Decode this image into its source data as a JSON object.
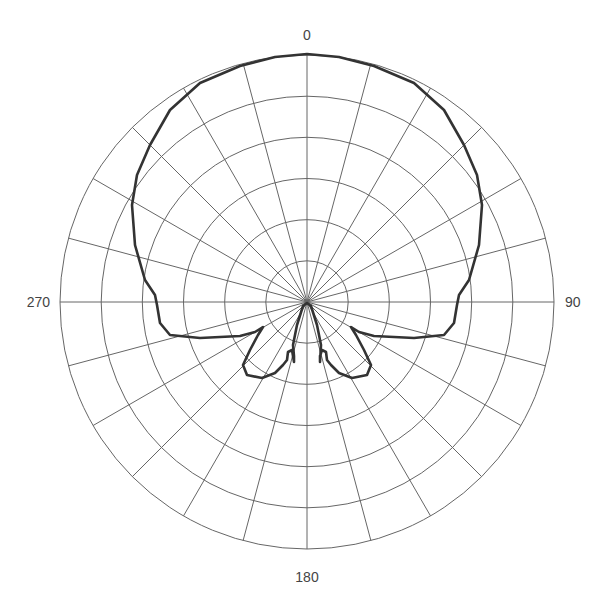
{
  "chart_data": {
    "type": "polar-line",
    "title": "",
    "angle_tick_labels": [
      {
        "angle": 0,
        "label": "0"
      },
      {
        "angle": 90,
        "label": "90"
      },
      {
        "angle": 180,
        "label": "180"
      },
      {
        "angle": 270,
        "label": "270"
      }
    ],
    "angular_gridlines_deg": [
      0,
      15,
      30,
      45,
      60,
      75,
      90,
      105,
      120,
      135,
      150,
      165,
      180,
      195,
      210,
      225,
      240,
      255,
      270,
      285,
      300,
      315,
      330,
      345
    ],
    "radial_rings": 6,
    "radial_range": [
      0,
      1
    ],
    "grid": true,
    "legend": null,
    "series": [
      {
        "name": "radiation-pattern",
        "color": "#333333",
        "note": "Normalized radius (0-1) vs angle in degrees, clockwise from top (0). Cardioid-like main lobe with two small back lobes.",
        "points": [
          {
            "angle": 0,
            "r": 1.0
          },
          {
            "angle": 15,
            "r": 0.99
          },
          {
            "angle": 30,
            "r": 0.97
          },
          {
            "angle": 45,
            "r": 0.94
          },
          {
            "angle": 60,
            "r": 0.88
          },
          {
            "angle": 75,
            "r": 0.72
          },
          {
            "angle": 90,
            "r": 0.62
          },
          {
            "angle": 100,
            "r": 0.64
          },
          {
            "angle": 105,
            "r": 0.55
          },
          {
            "angle": 110,
            "r": 0.28
          },
          {
            "angle": 115,
            "r": 0.23
          },
          {
            "angle": 120,
            "r": 0.16
          },
          {
            "angle": 130,
            "r": 0.36
          },
          {
            "angle": 140,
            "r": 0.36
          },
          {
            "angle": 150,
            "r": 0.33
          },
          {
            "angle": 160,
            "r": 0.22
          },
          {
            "angle": 163,
            "r": 0.26
          },
          {
            "angle": 170,
            "r": 0.1
          },
          {
            "angle": 180,
            "r": 0.0
          },
          {
            "angle": 190,
            "r": 0.1
          },
          {
            "angle": 197,
            "r": 0.26
          },
          {
            "angle": 200,
            "r": 0.22
          },
          {
            "angle": 210,
            "r": 0.33
          },
          {
            "angle": 220,
            "r": 0.36
          },
          {
            "angle": 230,
            "r": 0.36
          },
          {
            "angle": 240,
            "r": 0.16
          },
          {
            "angle": 245,
            "r": 0.23
          },
          {
            "angle": 250,
            "r": 0.28
          },
          {
            "angle": 255,
            "r": 0.55
          },
          {
            "angle": 260,
            "r": 0.64
          },
          {
            "angle": 270,
            "r": 0.62
          },
          {
            "angle": 285,
            "r": 0.72
          },
          {
            "angle": 300,
            "r": 0.88
          },
          {
            "angle": 315,
            "r": 0.94
          },
          {
            "angle": 330,
            "r": 0.97
          },
          {
            "angle": 345,
            "r": 0.99
          },
          {
            "angle": 360,
            "r": 1.0
          }
        ]
      }
    ]
  },
  "labels": {
    "top": "0",
    "right": "90",
    "bottom": "180",
    "left": "270"
  },
  "colors": {
    "grid": "#666666",
    "trace": "#333333",
    "label": "#444444"
  }
}
